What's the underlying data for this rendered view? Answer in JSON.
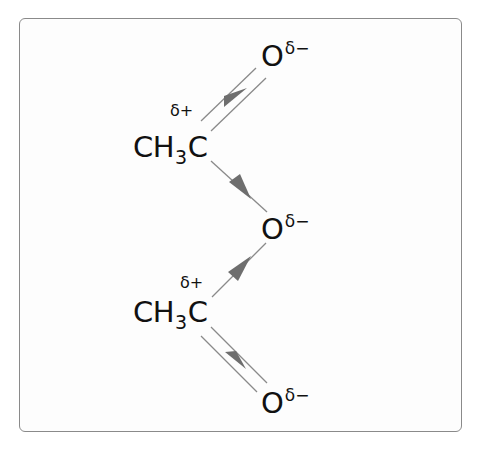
{
  "diagram": {
    "type": "polar-bond-dipole-diagram",
    "frame": {
      "border_color": "#8a8a8a",
      "background": "#fdfdfd"
    },
    "colors": {
      "bond_line": "#8a8a8a",
      "arrow": "#6e6e6e",
      "text": "#111111"
    },
    "groups": [
      {
        "id": "upper-acetyl",
        "main": "CH",
        "subscript": "3",
        "tail": "C",
        "partial_charge": "δ+"
      },
      {
        "id": "lower-acetyl",
        "main": "CH",
        "subscript": "3",
        "tail": "C",
        "partial_charge": "δ+"
      }
    ],
    "oxygens": [
      {
        "id": "top-oxygen",
        "symbol": "O",
        "partial_charge": "δ−"
      },
      {
        "id": "middle-oxygen",
        "symbol": "O",
        "partial_charge": "δ−"
      },
      {
        "id": "bottom-oxygen",
        "symbol": "O",
        "partial_charge": "δ−"
      }
    ],
    "bonds": [
      {
        "from": "upper-acetyl",
        "to": "top-oxygen",
        "order": 2,
        "dipole_arrow_toward": "top-oxygen"
      },
      {
        "from": "upper-acetyl",
        "to": "middle-oxygen",
        "order": 1,
        "dipole_arrow_toward": "middle-oxygen"
      },
      {
        "from": "lower-acetyl",
        "to": "middle-oxygen",
        "order": 1,
        "dipole_arrow_toward": "middle-oxygen"
      },
      {
        "from": "lower-acetyl",
        "to": "bottom-oxygen",
        "order": 2,
        "dipole_arrow_toward": "bottom-oxygen"
      }
    ]
  }
}
